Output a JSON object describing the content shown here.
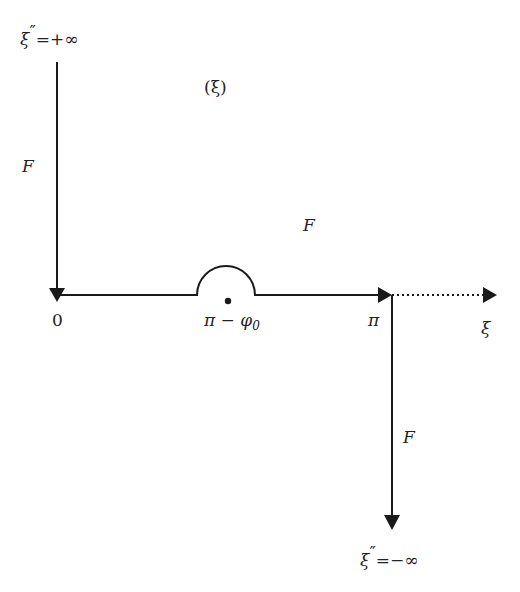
{
  "diagram": {
    "title_label": "(ξ)",
    "top_label": {
      "symbol": "ξ",
      "prime": "″",
      "rest": "=+∞"
    },
    "bottom_label": {
      "symbol": "ξ",
      "prime": "″",
      "rest": "=−∞"
    },
    "region_labels": [
      "F",
      "F",
      "F"
    ],
    "origin_label": "0",
    "indent_label": {
      "main": "π − φ",
      "sub": "0"
    },
    "pi_label": "π",
    "axis_label": "ξ",
    "colors": {
      "stroke": "#1a1a1a",
      "background": "#ffffff"
    }
  }
}
